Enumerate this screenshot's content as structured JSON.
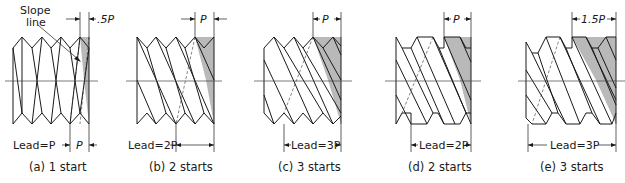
{
  "figure": {
    "shade_color": "#b9b9b9",
    "line_color": "#1a1a1a"
  },
  "panels": [
    {
      "id": "a",
      "caption": "(a) 1 start",
      "top_dim": ".5P",
      "bottom_label": "Lead=P",
      "bottom_dim": "P",
      "callout": "Slope line",
      "callout_line1": "Slope",
      "callout_line2": "line",
      "starts": 1
    },
    {
      "id": "b",
      "caption": "(b) 2 starts",
      "top_dim": "P",
      "bottom_label": "Lead=2P",
      "starts": 2
    },
    {
      "id": "c",
      "caption": "(c) 3 starts",
      "top_dim": "P",
      "bottom_label": "Lead=3P",
      "starts": 3
    },
    {
      "id": "d",
      "caption": "(d) 2 starts",
      "top_dim": "P",
      "bottom_label": "Lead=2P",
      "starts": 2
    },
    {
      "id": "e",
      "caption": "(e) 3 starts",
      "top_dim": "1.5P",
      "bottom_label": "Lead=3P",
      "starts": 3
    }
  ]
}
